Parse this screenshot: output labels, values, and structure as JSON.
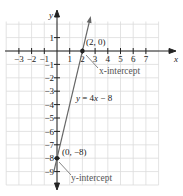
{
  "chart_data": {
    "type": "line",
    "title": "",
    "xlabel": "x",
    "ylabel": "y",
    "xlim": [
      -3.8,
      8
    ],
    "ylim": [
      -10,
      2.2
    ],
    "grid": true,
    "x_ticks": [
      -3,
      -2,
      -1,
      1,
      2,
      3,
      4,
      5,
      6,
      7
    ],
    "y_ticks": [
      1,
      -1,
      -2,
      -3,
      -4,
      -5,
      -6,
      -7,
      -8,
      -9
    ],
    "x_tick_labels": [
      "−3",
      "−2",
      "−1",
      "1",
      "2",
      "3",
      "4",
      "5",
      "6",
      "7"
    ],
    "y_tick_labels": [
      "1",
      "−1",
      "−2",
      "−3",
      "−4",
      "−5",
      "−6",
      "−7",
      "−8",
      "−9"
    ],
    "series": [
      {
        "name": "y = 4x − 8",
        "equation": "y = 4x - 8",
        "x": [
          -0.25,
          2.6
        ],
        "y": [
          -9,
          2.4
        ]
      }
    ],
    "points": [
      {
        "x": 2,
        "y": 0,
        "label": "(2, 0)",
        "annotation": "x-intercept"
      },
      {
        "x": 0,
        "y": -8,
        "label": "(0, −8)",
        "annotation": "y-intercept"
      }
    ],
    "line_label": "y = 4x − 8",
    "colors": {
      "line": "#666666",
      "grid": "#d9d9d9",
      "axis": "#222222",
      "annotation": "#777777"
    }
  }
}
